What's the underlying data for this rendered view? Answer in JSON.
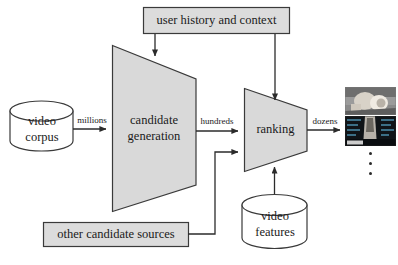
{
  "figure": {
    "type": "flow-diagram"
  },
  "nodes": {
    "user_history": {
      "label": "user history and context",
      "shape": "rectangle",
      "fill": "#dcdcdc"
    },
    "video_corpus": {
      "label_line1": "video",
      "label_line2": "corpus",
      "shape": "cylinder",
      "fill": "#ffffff"
    },
    "candidate_generation": {
      "label_line1": "candidate",
      "label_line2": "generation",
      "shape": "trapezoid",
      "fill": "#d9d9d9"
    },
    "other_candidate_sources": {
      "label": "other candidate sources",
      "shape": "rectangle",
      "fill": "#dcdcdc"
    },
    "ranking": {
      "label": "ranking",
      "shape": "trapezoid",
      "fill": "#d9d9d9"
    },
    "video_features": {
      "label_line1": "video",
      "label_line2": "features",
      "shape": "cylinder",
      "fill": "#ffffff"
    }
  },
  "edge_labels": {
    "corpus_to_candgen": "millions",
    "candgen_to_ranking": "hundreds",
    "ranking_to_output": "dozens"
  },
  "output": {
    "thumbnail_1": "video-thumbnail-person-photo",
    "thumbnail_2": "video-thumbnail-dark-screen",
    "ellipsis": "vertical-ellipsis-three-dots"
  },
  "colors": {
    "stroke": "#3a3a3a",
    "box_fill": "#dcdcdc",
    "trapezoid_fill": "#d9d9d9",
    "cylinder_fill": "#ffffff",
    "text": "#1a1a1a"
  }
}
